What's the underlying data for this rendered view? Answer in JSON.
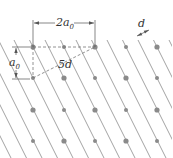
{
  "diagram": {
    "type": "crystal lattice planes",
    "labels": {
      "width_label": "2a",
      "width_sub": "0",
      "height_label": "a",
      "height_sub": "0",
      "diag_label": "5d",
      "spacing_label": "d"
    },
    "lattice": {
      "columns_x": [
        33,
        64,
        95,
        126,
        157
      ],
      "rows_y": [
        47,
        78,
        110,
        141
      ],
      "point_color": "#8a8a8a",
      "line_color": "#8c8c8c"
    }
  }
}
